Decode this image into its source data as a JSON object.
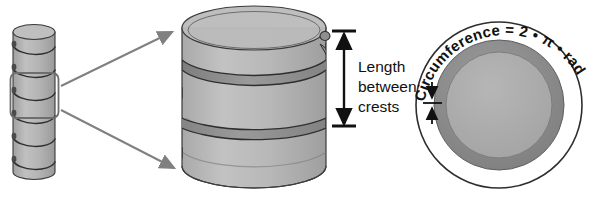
{
  "figure": {
    "background_color": "#ffffff"
  },
  "palette": {
    "cylinder_body": "#b3b3b3",
    "cylinder_body_dark": "#9c9c9c",
    "cylinder_top": "#b8b8b8",
    "thread_band": "#8f8f8f",
    "outline": "#3a3a3a",
    "arrow_gray": "#808080",
    "annulus_ring": "#8a8a8a",
    "inner_disc": "#ababab",
    "text": "#111111",
    "highlight_box": "#6e6e6e"
  },
  "panels": {
    "small_cylinder": {
      "name": "threaded rod overview",
      "thread_turns": 6,
      "highlight_box_label": "magnified region"
    },
    "large_cylinder": {
      "name": "magnified cylinder with helical thread",
      "transparent": true,
      "helix_turns": 2
    },
    "cross_section": {
      "name": "end-on cross section",
      "rings": [
        "outer circle",
        "thread annulus",
        "core disc"
      ]
    }
  },
  "labels": {
    "length_between_crests": {
      "line1": "Length",
      "line2": "between",
      "line3": "crests"
    },
    "circumference_formula": "Circumference = 2 • π • radius"
  },
  "arrows": {
    "callout_top": "magnification arrow to cylinder top",
    "callout_bottom": "magnification arrow to cylinder bottom",
    "pitch_dimension": "double-headed vertical dimension arrow",
    "ring_thickness_dimension": "double-headed thread depth arrow"
  }
}
